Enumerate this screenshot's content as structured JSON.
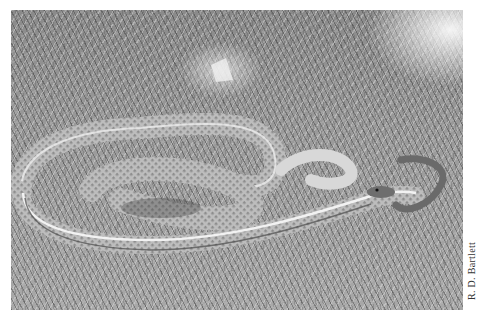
{
  "photo": {
    "subject": "striped snake coiled on grass",
    "tone": "grayscale",
    "colors": {
      "background": "#ffffff",
      "grass_mid": "#9a9a9a",
      "snake_body": "#c8c8c8",
      "snake_stripe": "#f2f2f2",
      "snake_dark": "#5a5a5a"
    }
  },
  "credit": {
    "text": "R. D. Bartlett"
  }
}
